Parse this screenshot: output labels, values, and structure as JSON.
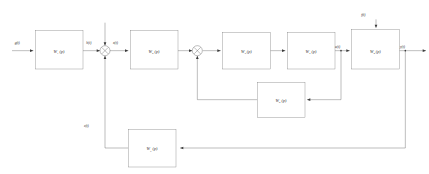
{
  "diagram": {
    "type": "block-diagram",
    "colors": {
      "background": "#ffffff",
      "wire": "#3a3a3a",
      "block_border": "#6b6b6b",
      "text": "#1d1d1d"
    },
    "blocks": [
      {
        "id": "w1",
        "base": "W",
        "sub": "1",
        "arg": " (p)",
        "x": 106,
        "y": 92,
        "w": 143,
        "h": 115
      },
      {
        "id": "w2",
        "base": "W",
        "sub": "2",
        "arg": " (p)",
        "x": 391,
        "y": 92,
        "w": 143,
        "h": 115
      },
      {
        "id": "w3",
        "base": "W",
        "sub": "3",
        "arg": " (p)",
        "x": 668,
        "y": 97,
        "w": 143,
        "h": 110
      },
      {
        "id": "w4",
        "base": "W",
        "sub": "4",
        "arg": " (p)",
        "x": 862,
        "y": 97,
        "w": 143,
        "h": 110
      },
      {
        "id": "w5",
        "base": "W",
        "sub": "5",
        "arg": " (p)",
        "x": 1055,
        "y": 88,
        "w": 143,
        "h": 119
      },
      {
        "id": "w6",
        "base": "W",
        "sub": "6",
        "arg": " (p)",
        "x": 772,
        "y": 247,
        "w": 143,
        "h": 105
      },
      {
        "id": "w7",
        "base": "W",
        "sub": "7",
        "arg": " (p)",
        "x": 385,
        "y": 388,
        "w": 143,
        "h": 113
      }
    ],
    "junctions": [
      {
        "id": "sum1",
        "cx": 315,
        "cy": 152,
        "r": 15
      },
      {
        "id": "sum2",
        "cx": 592,
        "cy": 152,
        "r": 15
      }
    ],
    "signals": [
      {
        "id": "g",
        "base": "g",
        "arg": "(t)",
        "x": 44,
        "y": 131
      },
      {
        "id": "h",
        "base": "h",
        "arg": "(t)",
        "x": 259,
        "y": 131
      },
      {
        "id": "x",
        "base": "x",
        "arg": "(t)",
        "x": 339,
        "y": 131
      },
      {
        "id": "u",
        "base": "u",
        "arg": "(t)",
        "x": 1005,
        "y": 139
      },
      {
        "id": "y",
        "base": "y",
        "arg": "(t)",
        "x": 1200,
        "y": 139
      },
      {
        "id": "f",
        "base": "f",
        "arg": "(t)",
        "x": 1060,
        "y": 48
      },
      {
        "id": "z",
        "base": "z",
        "arg": "(t)",
        "x": 252,
        "y": 382
      }
    ]
  }
}
